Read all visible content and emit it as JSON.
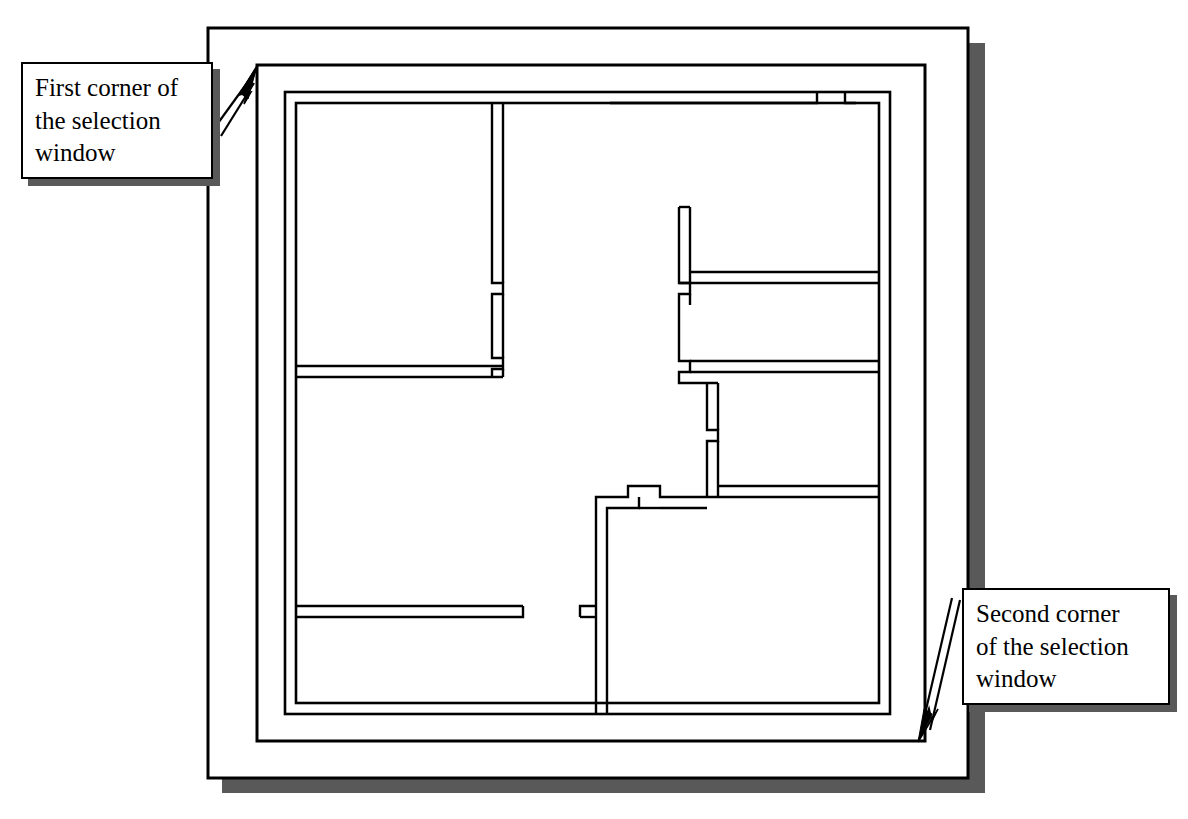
{
  "figure": {
    "type": "floor-plan-selection-diagram"
  },
  "callouts": [
    {
      "id": "first-corner",
      "lines": [
        "First corner of",
        "the selection",
        "window"
      ],
      "full_text": "First corner of the selection window",
      "pointer": "up-right",
      "target": "selection-window-top-left-corner"
    },
    {
      "id": "second-corner",
      "lines": [
        "Second corner",
        "of the selection",
        "window"
      ],
      "full_text": "Second corner of the selection window",
      "pointer": "down-left",
      "target": "selection-window-bottom-right-corner"
    }
  ],
  "colors": {
    "ink": "#000000",
    "paper": "#ffffff",
    "shadow": "#595959",
    "shadow_light": "#6e6e6e"
  },
  "drawing": {
    "outer_frame": {
      "x": 208,
      "y": 28,
      "width": 760,
      "height": 750
    },
    "selection_window": {
      "x": 257,
      "y": 65,
      "width": 668,
      "height": 676
    },
    "building_outer_wall": {
      "x": 285,
      "y": 92,
      "width": 605,
      "height": 622
    },
    "wall_thickness": 11,
    "rooms": [
      {
        "name": "top-left-room",
        "x": 297,
        "y": 104,
        "width": 195,
        "height": 262
      },
      {
        "name": "bottom-left-room",
        "x": 297,
        "y": 377,
        "width": 292,
        "height": 240
      },
      {
        "name": "upper-right-room",
        "x": 684,
        "y": 104,
        "width": 195,
        "height": 162
      },
      {
        "name": "middle-right-room",
        "x": 684,
        "y": 272,
        "width": 195,
        "height": 100
      },
      {
        "name": "center-right-room",
        "x": 718,
        "y": 378,
        "width": 161,
        "height": 113
      },
      {
        "name": "bottom-right-room",
        "x": 596,
        "y": 497,
        "width": 283,
        "height": 217
      }
    ]
  }
}
